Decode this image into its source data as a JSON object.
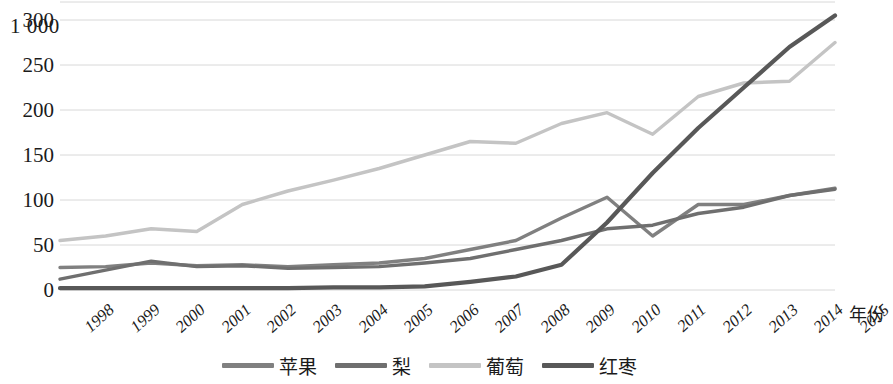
{
  "chart_data": {
    "type": "line",
    "title": "",
    "xlabel": "年份",
    "ylabel": "",
    "y_unit_label": "1 000",
    "categories": [
      "1998",
      "1999",
      "2000",
      "2001",
      "2002",
      "2003",
      "2004",
      "2005",
      "2006",
      "2007",
      "2008",
      "2009",
      "2010",
      "2011",
      "2012",
      "2013",
      "2014",
      "2015"
    ],
    "yticks": [
      0,
      50,
      100,
      150,
      200,
      250,
      300
    ],
    "ylim": [
      0,
      300
    ],
    "grid": true,
    "legend_position": "bottom",
    "series": [
      {
        "name": "苹果",
        "color": "#808080",
        "values": [
          25,
          26,
          30,
          27,
          28,
          26,
          28,
          30,
          35,
          45,
          55,
          80,
          103,
          60,
          95,
          95,
          105,
          113
        ]
      },
      {
        "name": "梨",
        "color": "#6f6f6f",
        "values": [
          12,
          22,
          32,
          26,
          27,
          24,
          25,
          26,
          30,
          35,
          45,
          55,
          68,
          72,
          85,
          92,
          105,
          112
        ]
      },
      {
        "name": "葡萄",
        "color": "#c4c4c4",
        "values": [
          55,
          60,
          68,
          65,
          95,
          110,
          122,
          135,
          150,
          165,
          163,
          185,
          197,
          173,
          215,
          230,
          232,
          275
        ]
      },
      {
        "name": "红枣",
        "color": "#585858",
        "values": [
          2,
          2,
          2,
          2,
          2,
          2,
          3,
          3,
          4,
          9,
          15,
          28,
          75,
          130,
          180,
          225,
          270,
          305
        ]
      }
    ]
  }
}
